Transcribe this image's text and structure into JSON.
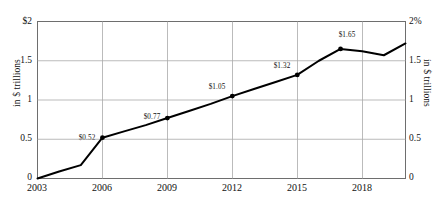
{
  "chart_data": {
    "type": "line",
    "title": "",
    "xlabel": "",
    "ylabel": "in $ trillions",
    "y2label": "in $ trillions",
    "x": [
      2003,
      2004,
      2005,
      2006,
      2007,
      2008,
      2009,
      2010,
      2011,
      2012,
      2013,
      2014,
      2015,
      2016,
      2017,
      2018,
      2019,
      2020
    ],
    "values": [
      0.0,
      0.09,
      0.17,
      0.52,
      0.6,
      0.68,
      0.77,
      0.86,
      0.95,
      1.05,
      1.14,
      1.23,
      1.32,
      1.5,
      1.65,
      1.62,
      1.57,
      1.72
    ],
    "xlim": [
      2003,
      2020
    ],
    "ylim": [
      0,
      2
    ],
    "y2lim": [
      0,
      2
    ],
    "grid": true,
    "legend": "none",
    "line_color": "#000000",
    "grid_color": "#a9a9a9",
    "axis_color": "#6e6e6e",
    "x_ticks": [
      "2003",
      "2006",
      "2009",
      "2012",
      "2015",
      "2018"
    ],
    "y_ticks_left": [
      "$2",
      "1.5",
      "1",
      "0.5",
      "0"
    ],
    "y_ticks_right": [
      "2%",
      "1.5",
      "1",
      "0.5",
      "0"
    ],
    "point_labels": [
      {
        "label": "$0.52",
        "x": 2006,
        "y": 0.52
      },
      {
        "label": "$0.77",
        "x": 2009,
        "y": 0.77
      },
      {
        "label": "$1.05",
        "x": 2012,
        "y": 1.05
      },
      {
        "label": "$1.32",
        "x": 2015,
        "y": 1.32
      },
      {
        "label": "$1.65",
        "x": 2017,
        "y": 1.65
      }
    ]
  }
}
